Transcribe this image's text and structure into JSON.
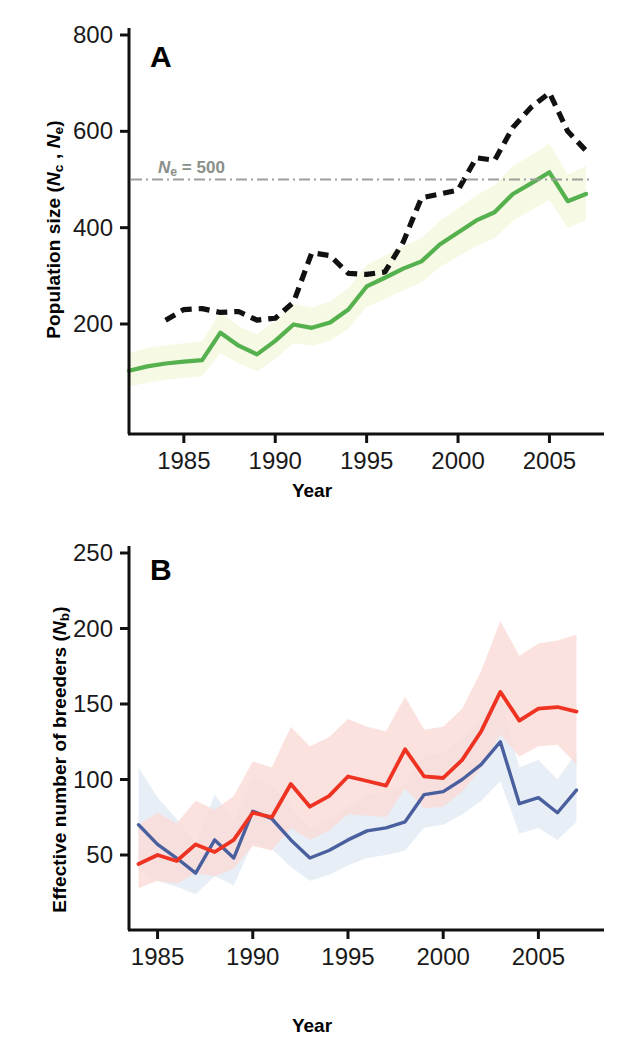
{
  "figure": {
    "background": "#ffffff",
    "width": 624,
    "height": 1055
  },
  "panel_a": {
    "letter": "A",
    "xlabel": "Year",
    "ylabel_prefix": "Population size (",
    "ylabel_n1": "N",
    "ylabel_sub1": "c",
    "ylabel_mid": " , ",
    "ylabel_n2": "N",
    "ylabel_sub2": "e",
    "ylabel_suffix": ")",
    "reference_label_n": "N",
    "reference_label_sub": "e",
    "reference_label_value": " = 500",
    "ytick_labels": [
      "800",
      "600",
      "400",
      "200"
    ],
    "xtick_labels": [
      "1985",
      "1990",
      "1995",
      "2000",
      "2005"
    ],
    "colors": {
      "census_line": "#55b04e",
      "census_band": "#f6f9e3",
      "effective_line": "#111111",
      "reference_line": "#9aa09a"
    }
  },
  "panel_b": {
    "letter": "B",
    "xlabel": "Year",
    "ylabel_prefix": "Effective number of breeders (",
    "ylabel_n": "N",
    "ylabel_sub": "b",
    "ylabel_suffix": ")",
    "ytick_labels": [
      "250",
      "200",
      "150",
      "100",
      "50"
    ],
    "xtick_labels": [
      "1985",
      "1990",
      "1995",
      "2000",
      "2005"
    ],
    "colors": {
      "series1_line": "#ee3322",
      "series1_band": "#fadcd8",
      "series2_line": "#4a5f9e",
      "series2_band": "#e6edf5",
      "overlap_band": "#e2e2e2"
    }
  },
  "chart_data": [
    {
      "type": "line",
      "panel": "A",
      "title": "",
      "xlabel": "Year",
      "ylabel": "Population size (Nc , Ne)",
      "xlim": [
        1982,
        2007
      ],
      "ylim": [
        0,
        800
      ],
      "ytick_values": [
        200,
        400,
        600,
        800
      ],
      "xtick_values": [
        1985,
        1990,
        1995,
        2000,
        2005
      ],
      "grid": false,
      "legend": "none",
      "annotations": [
        {
          "text": "Ne = 500",
          "y": 500,
          "type": "horizontal-reference-line",
          "style": "dash-dot",
          "color": "#9aa09a"
        }
      ],
      "series": [
        {
          "name": "Census population size (Nc)",
          "style": "dashed",
          "color": "#111111",
          "x": [
            1984,
            1985,
            1986,
            1987,
            1988,
            1989,
            1990,
            1991,
            1992,
            1993,
            1994,
            1995,
            1996,
            1997,
            1998,
            1999,
            2000,
            2001,
            2002,
            2003,
            2004,
            2005,
            2006,
            2007
          ],
          "values": [
            208,
            230,
            232,
            224,
            226,
            208,
            212,
            245,
            348,
            342,
            305,
            303,
            308,
            370,
            462,
            470,
            478,
            545,
            540,
            608,
            650,
            680,
            600,
            560
          ]
        },
        {
          "name": "Effective population size (Ne)",
          "style": "solid",
          "color": "#55b04e",
          "x": [
            1982,
            1983,
            1984,
            1985,
            1986,
            1987,
            1988,
            1989,
            1990,
            1991,
            1992,
            1993,
            1994,
            1995,
            1996,
            1997,
            1998,
            1999,
            2000,
            2001,
            2002,
            2003,
            2004,
            2005,
            2006,
            2007
          ],
          "values": [
            103,
            112,
            118,
            122,
            125,
            182,
            155,
            137,
            165,
            199,
            192,
            203,
            230,
            278,
            296,
            315,
            330,
            365,
            390,
            415,
            432,
            470,
            492,
            515,
            455,
            470
          ],
          "band": {
            "color": "#f6f9e3",
            "lower": [
              70,
              78,
              84,
              88,
              92,
              140,
              118,
              102,
              128,
              160,
              155,
              165,
              190,
              236,
              252,
              270,
              286,
              318,
              340,
              362,
              378,
              414,
              436,
              458,
              400,
              415
            ],
            "upper": [
              140,
              150,
              156,
              160,
              164,
              226,
              196,
              178,
              206,
              242,
              234,
              246,
              274,
              322,
              342,
              362,
              378,
              414,
              440,
              468,
              488,
              528,
              550,
              575,
              510,
              528
            ]
          }
        }
      ]
    },
    {
      "type": "line",
      "panel": "B",
      "title": "",
      "xlabel": "Year",
      "ylabel": "Effective number of breeders (Nb)",
      "xlim": [
        1983.5,
        2007.5
      ],
      "ylim": [
        0,
        250
      ],
      "ytick_values": [
        50,
        100,
        150,
        200,
        250
      ],
      "xtick_values": [
        1985,
        1990,
        1995,
        2000,
        2005
      ],
      "grid": false,
      "legend": "none",
      "series": [
        {
          "name": "Nb estimate (red method)",
          "style": "solid",
          "color": "#ee3322",
          "x": [
            1984,
            1985,
            1986,
            1987,
            1988,
            1989,
            1990,
            1991,
            1992,
            1993,
            1994,
            1995,
            1996,
            1997,
            1998,
            1999,
            2000,
            2001,
            2002,
            2003,
            2004,
            2005,
            2006,
            2007
          ],
          "values": [
            44,
            50,
            46,
            57,
            52,
            60,
            78,
            75,
            97,
            82,
            89,
            102,
            99,
            96,
            120,
            102,
            101,
            113,
            132,
            158,
            139,
            147,
            148,
            145
          ],
          "band": {
            "color": "#fadcd8",
            "lower": [
              28,
              33,
              31,
              38,
              36,
              41,
              56,
              53,
              68,
              60,
              66,
              77,
              76,
              75,
              94,
              81,
              82,
              92,
              108,
              130,
              115,
              122,
              123,
              110
            ],
            "upper": [
              70,
              78,
              71,
              86,
              80,
              89,
              112,
              108,
              135,
              122,
              128,
              140,
              135,
              132,
              155,
              133,
              135,
              147,
              172,
              205,
              182,
              190,
              192,
              196
            ]
          }
        },
        {
          "name": "Nb estimate (blue method)",
          "style": "solid",
          "color": "#4a5f9e",
          "x": [
            1984,
            1985,
            1986,
            1987,
            1988,
            1989,
            1990,
            1991,
            1992,
            1993,
            1994,
            1995,
            1996,
            1997,
            1998,
            1999,
            2000,
            2001,
            2002,
            2003,
            2004,
            2005,
            2006,
            2007
          ],
          "values": [
            70,
            57,
            48,
            38,
            60,
            48,
            79,
            74,
            60,
            48,
            53,
            60,
            66,
            68,
            72,
            90,
            92,
            100,
            110,
            125,
            84,
            88,
            78,
            93
          ],
          "band": {
            "color": "#e6edf5",
            "lower": [
              40,
              33,
              29,
              24,
              36,
              30,
              58,
              54,
              42,
              33,
              37,
              43,
              48,
              50,
              53,
              68,
              70,
              77,
              86,
              99,
              64,
              68,
              60,
              72
            ],
            "upper": [
              108,
              88,
              74,
              58,
              90,
              73,
              102,
              96,
              82,
              68,
              74,
              82,
              90,
              92,
              97,
              116,
              118,
              128,
              140,
              156,
              108,
              113,
              100,
              118
            ]
          }
        }
      ]
    }
  ]
}
